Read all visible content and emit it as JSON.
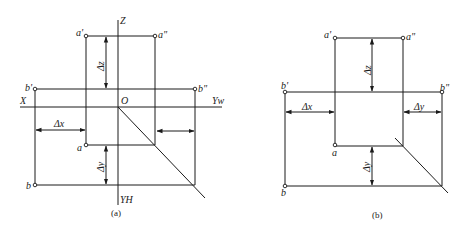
{
  "figure_a": {
    "caption": "(a)",
    "axes": {
      "z": "Z",
      "x": "X",
      "origin": "O",
      "yw": "Yw",
      "yh": "YH"
    },
    "points": {
      "a_prime": "a'",
      "a_dprime": "a\"",
      "b_prime": "b'",
      "b_dprime": "b\"",
      "a": "a",
      "b": "b"
    },
    "dims": {
      "dz": "Δz",
      "dx": "Δx",
      "dy": "Δy"
    }
  },
  "figure_b": {
    "caption": "(b)",
    "points": {
      "a_prime": "a'",
      "a_dprime": "a\"",
      "b_prime": "b'",
      "b_dprime": "b\"",
      "a": "a",
      "b": "b"
    },
    "dims": {
      "dz": "Δz",
      "dx": "Δx",
      "dy_right": "Δy",
      "dy": "Δy"
    }
  }
}
